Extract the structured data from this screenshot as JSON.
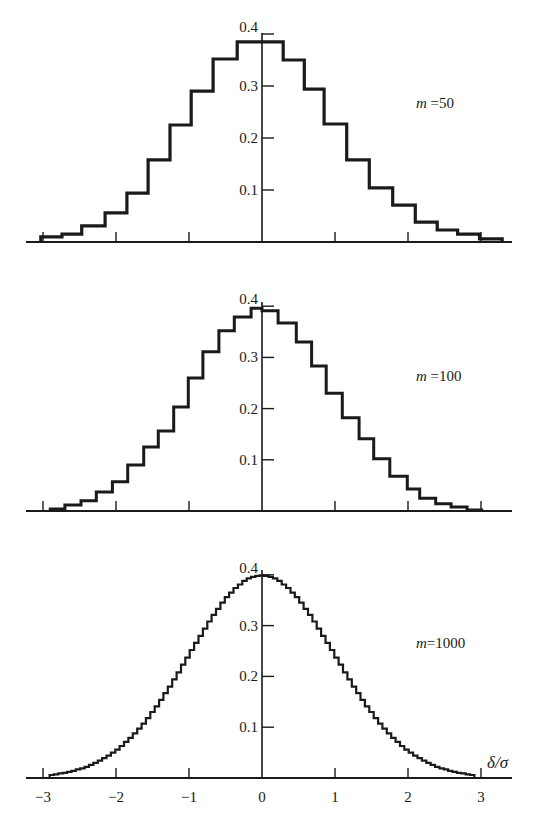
{
  "figure": {
    "background": "#ffffff",
    "ink_color": "#1a1a1a"
  },
  "chart_data": [
    {
      "type": "bar",
      "style": "step-histogram",
      "title": "",
      "label": "m=50",
      "label_var": "m",
      "label_value": "50",
      "xlabel": "",
      "ylabel": "",
      "xlim": [
        -3.3,
        3.45
      ],
      "ylim": [
        0,
        0.42
      ],
      "yticks": [
        0.1,
        0.2,
        0.3,
        0.4
      ],
      "ytick_labels": [
        "0.1",
        "0.2",
        "0.3",
        "0.4"
      ],
      "xticks": [
        -3,
        -2,
        -1,
        0,
        1,
        2,
        3
      ],
      "xtick_labels": [],
      "grid": false,
      "bin_edges": [
        -3.03,
        -2.74,
        -2.47,
        -2.15,
        -1.85,
        -1.56,
        -1.26,
        -0.97,
        -0.67,
        -0.34,
        0.29,
        0.58,
        0.85,
        1.16,
        1.47,
        1.79,
        2.1,
        2.4,
        2.68,
        2.98,
        3.29
      ],
      "values": [
        0.01,
        0.015,
        0.031,
        0.056,
        0.094,
        0.158,
        0.225,
        0.29,
        0.352,
        0.385,
        0.35,
        0.294,
        0.227,
        0.158,
        0.104,
        0.071,
        0.038,
        0.023,
        0.015,
        0.006
      ]
    },
    {
      "type": "bar",
      "style": "step-histogram",
      "title": "",
      "label": "m=100",
      "label_var": "m",
      "label_value": "100",
      "xlabel": "",
      "ylabel": "",
      "xlim": [
        -3.3,
        3.45
      ],
      "ylim": [
        0,
        0.42
      ],
      "yticks": [
        0.1,
        0.2,
        0.3,
        0.4
      ],
      "ytick_labels": [
        "0.1",
        "0.2",
        "0.3",
        "0.4"
      ],
      "xticks": [
        -3,
        -2,
        -1,
        0,
        1,
        2,
        3
      ],
      "xtick_labels": [],
      "grid": false,
      "bin_edges": [
        -2.9,
        -2.7,
        -2.48,
        -2.27,
        -2.05,
        -1.84,
        -1.62,
        -1.42,
        -1.21,
        -1.01,
        -0.81,
        -0.59,
        -0.38,
        -0.15,
        0.0,
        0.22,
        0.47,
        0.68,
        0.88,
        1.1,
        1.33,
        1.53,
        1.75,
        1.99,
        2.16,
        2.38,
        2.59,
        2.81,
        3.01
      ],
      "values": [
        0.004,
        0.012,
        0.02,
        0.037,
        0.057,
        0.09,
        0.125,
        0.156,
        0.203,
        0.26,
        0.311,
        0.352,
        0.379,
        0.396,
        0.391,
        0.367,
        0.33,
        0.283,
        0.23,
        0.182,
        0.141,
        0.102,
        0.068,
        0.043,
        0.025,
        0.014,
        0.008,
        0.002
      ]
    },
    {
      "type": "bar",
      "style": "step-histogram",
      "title": "",
      "label": "m=1000",
      "label_var": "m",
      "label_value": "1000",
      "xlabel": "δ/σ",
      "ylabel": "",
      "xlim": [
        -3.3,
        3.45
      ],
      "ylim": [
        0,
        0.42
      ],
      "yticks": [
        0.1,
        0.2,
        0.3,
        0.4
      ],
      "ytick_labels": [
        "0.1",
        "0.2",
        "0.3",
        "0.4"
      ],
      "xticks": [
        -3,
        -2,
        -1,
        0,
        1,
        2,
        3
      ],
      "xtick_labels": [
        "−3",
        "−2",
        "−1",
        "0",
        "1",
        "2",
        "3"
      ],
      "grid": false,
      "bin_start": -2.91,
      "bin_width": 0.06,
      "values": [
        0.006,
        0.007,
        0.009,
        0.01,
        0.012,
        0.014,
        0.017,
        0.019,
        0.022,
        0.026,
        0.03,
        0.034,
        0.039,
        0.044,
        0.05,
        0.056,
        0.063,
        0.071,
        0.079,
        0.088,
        0.097,
        0.107,
        0.118,
        0.13,
        0.141,
        0.154,
        0.167,
        0.18,
        0.194,
        0.208,
        0.223,
        0.237,
        0.252,
        0.266,
        0.28,
        0.294,
        0.308,
        0.321,
        0.333,
        0.345,
        0.356,
        0.365,
        0.374,
        0.381,
        0.388,
        0.393,
        0.396,
        0.398,
        0.399,
        0.398,
        0.396,
        0.393,
        0.388,
        0.381,
        0.374,
        0.365,
        0.356,
        0.345,
        0.333,
        0.321,
        0.308,
        0.294,
        0.28,
        0.266,
        0.252,
        0.237,
        0.223,
        0.208,
        0.194,
        0.18,
        0.167,
        0.154,
        0.141,
        0.13,
        0.118,
        0.107,
        0.097,
        0.088,
        0.079,
        0.071,
        0.063,
        0.056,
        0.05,
        0.044,
        0.039,
        0.034,
        0.03,
        0.026,
        0.022,
        0.019,
        0.017,
        0.014,
        0.012,
        0.01,
        0.009,
        0.007,
        0.006
      ]
    }
  ],
  "layout_px": {
    "x_center": 262,
    "px_per_unit_x": 73,
    "axis_x_start": 26,
    "axis_x_end": 512,
    "panels": [
      {
        "baseline": 242,
        "px_per_unit_y": 520,
        "label_x": 416,
        "label_y": 108,
        "axis_top": 33,
        "stroke": 3.2
      },
      {
        "baseline": 511,
        "px_per_unit_y": 512,
        "label_x": 416,
        "label_y": 381,
        "axis_top": 302,
        "stroke": 3.0
      },
      {
        "baseline": 778,
        "px_per_unit_y": 508,
        "label_x": 416,
        "label_y": 648,
        "axis_top": 570,
        "stroke": 2.2
      }
    ]
  }
}
